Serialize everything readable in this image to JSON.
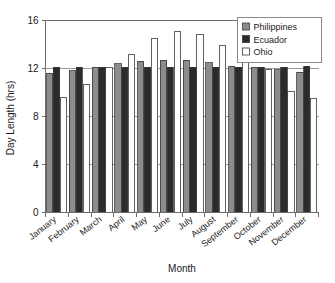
{
  "chart_data": {
    "type": "bar",
    "title": "",
    "xlabel": "Month",
    "ylabel": "Day Length (hrs)",
    "categories": [
      "January",
      "February",
      "March",
      "April",
      "May",
      "June",
      "July",
      "August",
      "September",
      "October",
      "November",
      "December"
    ],
    "series": [
      {
        "name": "Philippines",
        "color": "#8c8c8c",
        "values": [
          11.6,
          11.8,
          12.1,
          12.4,
          12.6,
          12.7,
          12.7,
          12.5,
          12.2,
          12.1,
          11.9,
          11.7
        ]
      },
      {
        "name": "Ecuador",
        "color": "#2b2b2b",
        "values": [
          12.1,
          12.1,
          12.1,
          12.1,
          12.1,
          12.1,
          12.1,
          12.1,
          12.1,
          12.1,
          12.1,
          12.2
        ]
      },
      {
        "name": "Ohio",
        "color": "#ffffff",
        "values": [
          9.6,
          10.7,
          12.1,
          13.2,
          14.5,
          15.1,
          14.8,
          13.9,
          12.5,
          11.9,
          10.1,
          9.5
        ]
      }
    ],
    "ylim": [
      0,
      16
    ],
    "yticks": [
      0,
      4,
      8,
      12,
      16
    ],
    "ytick_labels": [
      "0",
      "4",
      "8",
      "12",
      "16"
    ],
    "grid": true,
    "legend_position": "top-right",
    "bar_edge_color": "#3a3a3a",
    "axis_color": "#6e6e6e",
    "background": "#ffffff"
  },
  "legend": {
    "entries": [
      {
        "label": "Philippines",
        "swatch": "#8c8c8c"
      },
      {
        "label": "Ecuador",
        "swatch": "#2b2b2b"
      },
      {
        "label": "Ohio",
        "swatch": "#ffffff"
      }
    ]
  }
}
